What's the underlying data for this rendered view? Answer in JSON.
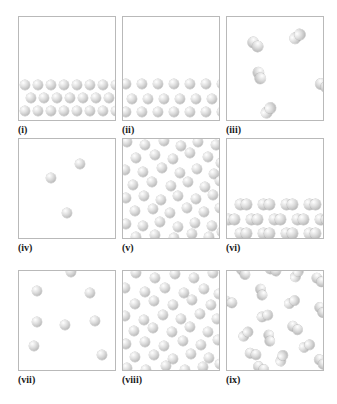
{
  "figure": {
    "background_color": "#ffffff",
    "box_border_color": "#b9b9b9",
    "atom_color": "#c9c9c9",
    "atom_highlight_color": "#ffffff",
    "columns": 3,
    "rows": 3
  },
  "panels": [
    {
      "id": "i",
      "label": "(i)",
      "particle_type": "monatomic",
      "phase": "solid",
      "description": "Ordered close-packed crystal lattice occupying the lower portion of the box; three horizontal rows of spheres",
      "atom_count": 21,
      "radius": 5.2,
      "atoms": [
        {
          "x": 1,
          "y": 63
        },
        {
          "x": 14,
          "y": 63
        },
        {
          "x": 27,
          "y": 63
        },
        {
          "x": 40,
          "y": 63
        },
        {
          "x": 53,
          "y": 63
        },
        {
          "x": 66,
          "y": 63
        },
        {
          "x": 79,
          "y": 63
        },
        {
          "x": 92,
          "y": 63
        },
        {
          "x": 7,
          "y": 76
        },
        {
          "x": 20,
          "y": 76
        },
        {
          "x": 33,
          "y": 76
        },
        {
          "x": 46,
          "y": 76
        },
        {
          "x": 59,
          "y": 76
        },
        {
          "x": 72,
          "y": 76
        },
        {
          "x": 85,
          "y": 76
        },
        {
          "x": 1,
          "y": 89
        },
        {
          "x": 14,
          "y": 89
        },
        {
          "x": 27,
          "y": 89
        },
        {
          "x": 40,
          "y": 89
        },
        {
          "x": 53,
          "y": 89
        },
        {
          "x": 66,
          "y": 89
        },
        {
          "x": 79,
          "y": 89
        },
        {
          "x": 92,
          "y": 89
        }
      ],
      "molecules": []
    },
    {
      "id": "ii",
      "label": "(ii)",
      "particle_type": "monatomic",
      "phase": "solid",
      "description": "Expanded crystal lattice in lower portion with wider lattice spacing than panel (i); three rows of spheres",
      "atom_count": 19,
      "radius": 5.2,
      "atoms": [
        {
          "x": -2,
          "y": 62
        },
        {
          "x": 14,
          "y": 62
        },
        {
          "x": 30,
          "y": 62
        },
        {
          "x": 46,
          "y": 62
        },
        {
          "x": 62,
          "y": 62
        },
        {
          "x": 78,
          "y": 62
        },
        {
          "x": 94,
          "y": 62
        },
        {
          "x": 4,
          "y": 77
        },
        {
          "x": 20,
          "y": 77
        },
        {
          "x": 36,
          "y": 77
        },
        {
          "x": 52,
          "y": 77
        },
        {
          "x": 68,
          "y": 77
        },
        {
          "x": 84,
          "y": 77
        },
        {
          "x": -2,
          "y": 90
        },
        {
          "x": 14,
          "y": 90
        },
        {
          "x": 30,
          "y": 90
        },
        {
          "x": 46,
          "y": 90
        },
        {
          "x": 62,
          "y": 90
        },
        {
          "x": 78,
          "y": 90
        },
        {
          "x": 94,
          "y": 90
        }
      ],
      "molecules": []
    },
    {
      "id": "iii",
      "label": "(iii)",
      "particle_type": "diatomic",
      "phase": "gas",
      "description": "Dilute gas of diatomic molecules; five well-separated dimers scattered through the box",
      "molecule_count": 5,
      "radius": 5.4,
      "atoms": [],
      "molecules": [
        {
          "x": 20,
          "y": 22,
          "angle": 42
        },
        {
          "x": 62,
          "y": 14,
          "angle": -38
        },
        {
          "x": 24,
          "y": 53,
          "angle": 72
        },
        {
          "x": 88,
          "y": 63,
          "angle": 30
        },
        {
          "x": 33,
          "y": 88,
          "angle": -50
        }
      ]
    },
    {
      "id": "iv",
      "label": "(iv)",
      "particle_type": "monatomic",
      "phase": "gas",
      "description": "Very dilute gas; three isolated single spheres far apart",
      "atom_count": 3,
      "radius": 5.0,
      "atoms": [
        {
          "x": 56,
          "y": 20
        },
        {
          "x": 27,
          "y": 34
        },
        {
          "x": 43,
          "y": 69
        }
      ],
      "molecules": []
    },
    {
      "id": "v",
      "label": "(v)",
      "particle_type": "monatomic",
      "phase": "liquid",
      "description": "Dense disordered liquid of single spheres filling the whole box",
      "atom_count": 44,
      "radius": 5.2,
      "atoms": [
        {
          "x": -1,
          "y": -2
        },
        {
          "x": 17,
          "y": 1
        },
        {
          "x": 36,
          "y": -3
        },
        {
          "x": 53,
          "y": 2
        },
        {
          "x": 70,
          "y": -2
        },
        {
          "x": 88,
          "y": 1
        },
        {
          "x": 8,
          "y": 14
        },
        {
          "x": 27,
          "y": 11
        },
        {
          "x": 45,
          "y": 15
        },
        {
          "x": 62,
          "y": 9
        },
        {
          "x": 80,
          "y": 13
        },
        {
          "x": 93,
          "y": 19
        },
        {
          "x": -3,
          "y": 26
        },
        {
          "x": 15,
          "y": 28
        },
        {
          "x": 34,
          "y": 24
        },
        {
          "x": 52,
          "y": 29
        },
        {
          "x": 69,
          "y": 25
        },
        {
          "x": 86,
          "y": 30
        },
        {
          "x": 5,
          "y": 41
        },
        {
          "x": 24,
          "y": 38
        },
        {
          "x": 43,
          "y": 42
        },
        {
          "x": 60,
          "y": 38
        },
        {
          "x": 77,
          "y": 43
        },
        {
          "x": 92,
          "y": 37
        },
        {
          "x": -2,
          "y": 54
        },
        {
          "x": 16,
          "y": 52
        },
        {
          "x": 33,
          "y": 56
        },
        {
          "x": 50,
          "y": 52
        },
        {
          "x": 68,
          "y": 55
        },
        {
          "x": 85,
          "y": 51
        },
        {
          "x": 7,
          "y": 67
        },
        {
          "x": 25,
          "y": 65
        },
        {
          "x": 42,
          "y": 69
        },
        {
          "x": 59,
          "y": 64
        },
        {
          "x": 76,
          "y": 68
        },
        {
          "x": 92,
          "y": 64
        },
        {
          "x": -2,
          "y": 80
        },
        {
          "x": 15,
          "y": 82
        },
        {
          "x": 32,
          "y": 78
        },
        {
          "x": 50,
          "y": 83
        },
        {
          "x": 67,
          "y": 79
        },
        {
          "x": 84,
          "y": 82
        },
        {
          "x": 8,
          "y": 93
        },
        {
          "x": 27,
          "y": 91
        },
        {
          "x": 46,
          "y": 94
        },
        {
          "x": 64,
          "y": 90
        },
        {
          "x": 81,
          "y": 93
        },
        {
          "x": 94,
          "y": 88
        }
      ],
      "molecules": []
    },
    {
      "id": "vi",
      "label": "(vi)",
      "particle_type": "diatomic",
      "phase": "solid",
      "description": "Crystalline solid of diatomic molecules in the lower portion; three rows of horizontally aligned dimers",
      "molecule_count": 14,
      "radius": 5.4,
      "atoms": [],
      "molecules": [
        {
          "x": 8,
          "y": 60,
          "angle": 0
        },
        {
          "x": 31,
          "y": 60,
          "angle": 0
        },
        {
          "x": 54,
          "y": 60,
          "angle": 0
        },
        {
          "x": 77,
          "y": 60,
          "angle": 0
        },
        {
          "x": -4,
          "y": 75,
          "angle": 0
        },
        {
          "x": 19,
          "y": 75,
          "angle": 0
        },
        {
          "x": 42,
          "y": 75,
          "angle": 0
        },
        {
          "x": 65,
          "y": 75,
          "angle": 0
        },
        {
          "x": 88,
          "y": 75,
          "angle": 0
        },
        {
          "x": 8,
          "y": 89,
          "angle": 0
        },
        {
          "x": 31,
          "y": 89,
          "angle": 0
        },
        {
          "x": 54,
          "y": 89,
          "angle": 0
        },
        {
          "x": 77,
          "y": 89,
          "angle": 0
        }
      ]
    },
    {
      "id": "vii",
      "label": "(vii)",
      "particle_type": "monatomic",
      "phase": "gas",
      "description": "Low-density gas of single spheres; eight atoms distributed loosely through the box",
      "atom_count": 8,
      "radius": 5.2,
      "atoms": [
        {
          "x": 47,
          "y": -4
        },
        {
          "x": 13,
          "y": 15
        },
        {
          "x": 66,
          "y": 17
        },
        {
          "x": 13,
          "y": 46
        },
        {
          "x": 41,
          "y": 49
        },
        {
          "x": 71,
          "y": 45
        },
        {
          "x": 10,
          "y": 70
        },
        {
          "x": 78,
          "y": 79
        }
      ],
      "molecules": []
    },
    {
      "id": "viii",
      "label": "(viii)",
      "particle_type": "monatomic",
      "phase": "liquid",
      "description": "Dense disordered liquid of single spheres filling the box; slightly lower density than panel (v)",
      "atom_count": 42,
      "radius": 5.0,
      "atoms": [
        {
          "x": 8,
          "y": -3
        },
        {
          "x": 27,
          "y": 2
        },
        {
          "x": 47,
          "y": -2
        },
        {
          "x": 66,
          "y": 2
        },
        {
          "x": 85,
          "y": -3
        },
        {
          "x": -3,
          "y": 12
        },
        {
          "x": 17,
          "y": 16
        },
        {
          "x": 37,
          "y": 12
        },
        {
          "x": 56,
          "y": 17
        },
        {
          "x": 76,
          "y": 13
        },
        {
          "x": 91,
          "y": 18
        },
        {
          "x": 7,
          "y": 28
        },
        {
          "x": 26,
          "y": 25
        },
        {
          "x": 45,
          "y": 29
        },
        {
          "x": 64,
          "y": 24
        },
        {
          "x": 83,
          "y": 29
        },
        {
          "x": -3,
          "y": 40
        },
        {
          "x": 16,
          "y": 44
        },
        {
          "x": 35,
          "y": 39
        },
        {
          "x": 53,
          "y": 43
        },
        {
          "x": 72,
          "y": 38
        },
        {
          "x": 89,
          "y": 43
        },
        {
          "x": 6,
          "y": 55
        },
        {
          "x": 25,
          "y": 52
        },
        {
          "x": 44,
          "y": 56
        },
        {
          "x": 62,
          "y": 51
        },
        {
          "x": 80,
          "y": 56
        },
        {
          "x": -2,
          "y": 68
        },
        {
          "x": 17,
          "y": 66
        },
        {
          "x": 36,
          "y": 70
        },
        {
          "x": 55,
          "y": 65
        },
        {
          "x": 73,
          "y": 69
        },
        {
          "x": 90,
          "y": 64
        },
        {
          "x": 7,
          "y": 81
        },
        {
          "x": 26,
          "y": 79
        },
        {
          "x": 45,
          "y": 83
        },
        {
          "x": 63,
          "y": 78
        },
        {
          "x": 81,
          "y": 82
        },
        {
          "x": -1,
          "y": 92
        },
        {
          "x": 18,
          "y": 94
        },
        {
          "x": 38,
          "y": 90
        },
        {
          "x": 57,
          "y": 94
        },
        {
          "x": 75,
          "y": 91
        },
        {
          "x": 92,
          "y": 88
        }
      ],
      "molecules": []
    },
    {
      "id": "ix",
      "label": "(ix)",
      "particle_type": "diatomic",
      "phase": "liquid",
      "description": "Moderately dense disordered fluid of diatomic molecules; dimers at varied orientations",
      "molecule_count": 15,
      "radius": 5.2,
      "atoms": [],
      "molecules": [
        {
          "x": 8,
          "y": -4,
          "angle": 55
        },
        {
          "x": 38,
          "y": -6,
          "angle": 20
        },
        {
          "x": 62,
          "y": -2,
          "angle": -62
        },
        {
          "x": 84,
          "y": 4,
          "angle": 40
        },
        {
          "x": 26,
          "y": 16,
          "angle": 75
        },
        {
          "x": -6,
          "y": 26,
          "angle": 18
        },
        {
          "x": 57,
          "y": 26,
          "angle": -30
        },
        {
          "x": 86,
          "y": 34,
          "angle": 60
        },
        {
          "x": 30,
          "y": 40,
          "angle": -18
        },
        {
          "x": 60,
          "y": 52,
          "angle": 35
        },
        {
          "x": 11,
          "y": 58,
          "angle": -45
        },
        {
          "x": 34,
          "y": 62,
          "angle": 80
        },
        {
          "x": 72,
          "y": 70,
          "angle": -25
        },
        {
          "x": 18,
          "y": 78,
          "angle": 15
        },
        {
          "x": 47,
          "y": 82,
          "angle": -70
        },
        {
          "x": 86,
          "y": 86,
          "angle": 50
        },
        {
          "x": 26,
          "y": 92,
          "angle": 30
        }
      ]
    }
  ]
}
